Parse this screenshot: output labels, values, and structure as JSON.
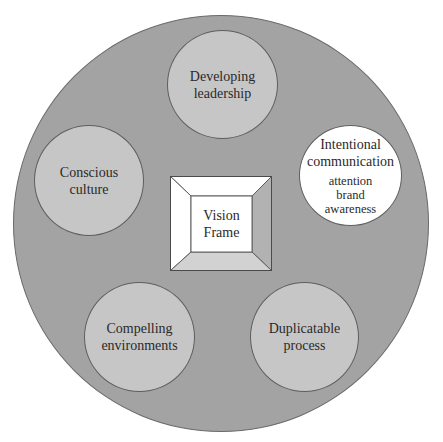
{
  "diagram": {
    "type": "concentric-hub-diagram",
    "colors": {
      "outer_ring": "#a3a3a3",
      "node_fill": "#c6c6c6",
      "highlight_node_fill": "#ffffff",
      "outline": "#5e5e5e",
      "frame_top": "#ffffff",
      "frame_left": "#ffffff",
      "frame_right": "#b2b2b2",
      "frame_bottom": "#d2d2d2",
      "frame_center": "#ffffff"
    },
    "center": {
      "label": "Vision\nFrame"
    },
    "nodes": [
      {
        "id": "developing-leadership",
        "label": "Developing\nleadership",
        "sub": "",
        "highlight": false
      },
      {
        "id": "intentional-communication",
        "label": "Intentional\ncommunication",
        "sub": "attention\nbrand\nawareness",
        "highlight": true
      },
      {
        "id": "duplicatable-process",
        "label": "Duplicatable\nprocess",
        "sub": "",
        "highlight": false
      },
      {
        "id": "compelling-environments",
        "label": "Compelling\nenvironments",
        "sub": "",
        "highlight": false
      },
      {
        "id": "conscious-culture",
        "label": "Conscious\nculture",
        "sub": "",
        "highlight": false
      }
    ]
  }
}
